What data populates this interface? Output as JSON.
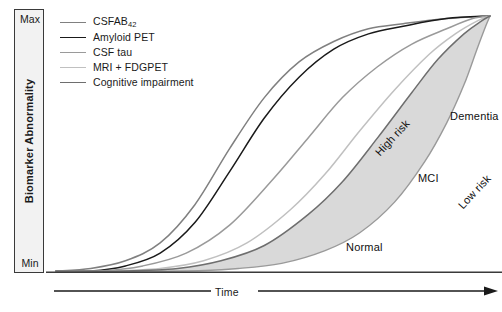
{
  "chart_data": {
    "type": "line",
    "title": "",
    "xlabel": "Time",
    "ylabel": "Biomarker Abnormality",
    "ylim_labels": [
      "Min",
      "Max"
    ],
    "xlim_labels": [],
    "grid": false,
    "legend_position": "top-left",
    "series": [
      {
        "name": "CSFAB42",
        "name_display": "CSFAB",
        "name_subscript": "42",
        "color": "#808080",
        "width": 1.5,
        "order": 1,
        "description": "Earliest-rising sigmoid, leftmost curve reaching Max first",
        "points": [
          [
            0,
            0
          ],
          [
            8,
            1
          ],
          [
            16,
            4
          ],
          [
            24,
            11
          ],
          [
            32,
            26
          ],
          [
            40,
            48
          ],
          [
            48,
            68
          ],
          [
            56,
            82
          ],
          [
            64,
            90
          ],
          [
            72,
            95
          ],
          [
            80,
            97
          ],
          [
            90,
            99
          ],
          [
            100,
            100
          ]
        ]
      },
      {
        "name": "Amyloid PET",
        "name_display": "Amyloid PET",
        "name_subscript": "",
        "color": "#1a1a1a",
        "width": 1.5,
        "order": 2,
        "description": "Second sigmoid, dark/black, closely trails CSFAB42",
        "points": [
          [
            0,
            0
          ],
          [
            8,
            0
          ],
          [
            16,
            2
          ],
          [
            24,
            7
          ],
          [
            32,
            19
          ],
          [
            40,
            39
          ],
          [
            48,
            60
          ],
          [
            56,
            76
          ],
          [
            64,
            87
          ],
          [
            72,
            93
          ],
          [
            80,
            96
          ],
          [
            90,
            99
          ],
          [
            100,
            100
          ]
        ]
      },
      {
        "name": "CSF tau",
        "name_display": "CSF tau",
        "name_subscript": "",
        "color": "#9a9a9a",
        "width": 1.5,
        "order": 3,
        "description": "Third sigmoid, medium grey",
        "points": [
          [
            0,
            0
          ],
          [
            10,
            0
          ],
          [
            20,
            2
          ],
          [
            30,
            7
          ],
          [
            40,
            18
          ],
          [
            50,
            36
          ],
          [
            58,
            52
          ],
          [
            66,
            68
          ],
          [
            74,
            80
          ],
          [
            82,
            89
          ],
          [
            90,
            95
          ],
          [
            96,
            99
          ],
          [
            100,
            100
          ]
        ]
      },
      {
        "name": "MRI + FDGPET",
        "name_display": "MRI + FDGPET",
        "name_subscript": "",
        "color": "#c0c0c0",
        "width": 1.5,
        "order": 4,
        "description": "Fourth sigmoid, lightest grey, rises later",
        "points": [
          [
            0,
            0
          ],
          [
            12,
            0
          ],
          [
            24,
            1
          ],
          [
            34,
            4
          ],
          [
            44,
            11
          ],
          [
            54,
            24
          ],
          [
            62,
            38
          ],
          [
            70,
            55
          ],
          [
            78,
            71
          ],
          [
            86,
            85
          ],
          [
            92,
            93
          ],
          [
            97,
            98
          ],
          [
            100,
            100
          ]
        ]
      },
      {
        "name": "Cognitive impairment",
        "name_display": "Cognitive impairment",
        "name_subscript": "",
        "color": "#6e6e6e",
        "width": 1.5,
        "order": 5,
        "description": "Latest-rising boundary; upper edge of shaded cognitive-response band (High risk edge)",
        "points": [
          [
            0,
            0
          ],
          [
            16,
            0
          ],
          [
            28,
            1
          ],
          [
            38,
            4
          ],
          [
            48,
            10
          ],
          [
            58,
            22
          ],
          [
            66,
            35
          ],
          [
            74,
            52
          ],
          [
            82,
            70
          ],
          [
            88,
            83
          ],
          [
            94,
            93
          ],
          [
            98,
            98
          ],
          [
            100,
            100
          ]
        ]
      }
    ],
    "band": {
      "name": "cognitive-response-band",
      "fill": "#d9d9d9",
      "stroke": "#9a9a9a",
      "upper_edge_label": "High risk",
      "lower_edge_label": "Low risk",
      "upper_points": [
        [
          0,
          0
        ],
        [
          16,
          0
        ],
        [
          28,
          1
        ],
        [
          38,
          4
        ],
        [
          48,
          10
        ],
        [
          58,
          22
        ],
        [
          66,
          35
        ],
        [
          74,
          52
        ],
        [
          82,
          70
        ],
        [
          88,
          83
        ],
        [
          94,
          93
        ],
        [
          98,
          98
        ],
        [
          100,
          100
        ]
      ],
      "lower_points": [
        [
          0,
          0
        ],
        [
          30,
          0
        ],
        [
          42,
          1
        ],
        [
          52,
          3
        ],
        [
          62,
          8
        ],
        [
          70,
          15
        ],
        [
          78,
          27
        ],
        [
          85,
          43
        ],
        [
          90,
          58
        ],
        [
          94,
          73
        ],
        [
          97,
          87
        ],
        [
          99,
          96
        ],
        [
          100,
          100
        ]
      ]
    },
    "zone_labels": [
      {
        "key": "normal",
        "text": "Normal"
      },
      {
        "key": "mci",
        "text": "MCI"
      },
      {
        "key": "dementia",
        "text": "Dementia"
      }
    ],
    "edge_labels": [
      {
        "key": "high-risk",
        "text": "High risk",
        "rotation_deg": -47
      },
      {
        "key": "low-risk",
        "text": "Low risk",
        "rotation_deg": -47
      }
    ]
  },
  "yaxis": {
    "max_label": "Max",
    "min_label": "Min",
    "title": "Biomarker Abnormality"
  },
  "xaxis": {
    "title": "Time",
    "arrow": "arrow-right"
  },
  "legend": {
    "items": [
      {
        "label": "CSFAB",
        "sub": "42",
        "color": "#808080"
      },
      {
        "label": "Amyloid PET",
        "sub": "",
        "color": "#1a1a1a"
      },
      {
        "label": "CSF tau",
        "sub": "",
        "color": "#9a9a9a"
      },
      {
        "label": "MRI + FDGPET",
        "sub": "",
        "color": "#c0c0c0"
      },
      {
        "label": "Cognitive impairment",
        "sub": "",
        "color": "#6e6e6e"
      }
    ]
  },
  "colors": {
    "band_fill": "#d9d9d9",
    "band_stroke": "#9a9a9a",
    "axis": "#3a3a3a",
    "axis_box_fill": "#f2f2f2",
    "text": "#1a1a1a"
  }
}
